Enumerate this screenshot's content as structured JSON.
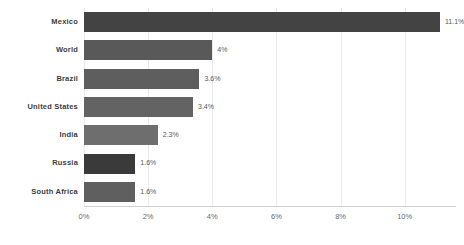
{
  "chart_data": {
    "type": "bar",
    "orientation": "horizontal",
    "title": "",
    "subtitle": "",
    "xlabel": "",
    "ylabel": "",
    "categories": [
      "Mexico",
      "World",
      "Brazil",
      "United States",
      "India",
      "Russia",
      "South Africa"
    ],
    "values": [
      11.1,
      4.0,
      3.6,
      3.4,
      2.3,
      1.6,
      1.6
    ],
    "value_labels": [
      "11.1%",
      "4%",
      "3.6%",
      "3.4%",
      "2.3%",
      "1.6%",
      "1.6%"
    ],
    "bar_colors": [
      "#434343",
      "#595959",
      "#5e5e5e",
      "#636363",
      "#6e6e6e",
      "#3a3a3a",
      "#5f5f5f"
    ],
    "xlim": [
      0,
      11.6
    ],
    "x_ticks": [
      0,
      2,
      4,
      6,
      8,
      10
    ],
    "x_tick_labels": [
      "0%",
      "2%",
      "4%",
      "6%",
      "8%",
      "10%"
    ],
    "grid": true,
    "grid_axis": "x",
    "grid_color": "#e9e9e9",
    "axis_line_color": "#cfcfcf",
    "legend": false,
    "background_color": "#ffffff",
    "label_color": "#3d3d3d",
    "tick_color": "#6b6b6b"
  }
}
